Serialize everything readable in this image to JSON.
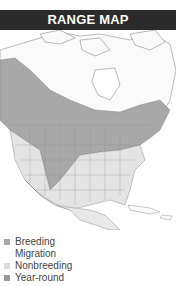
{
  "header": {
    "title": "RANGE MAP"
  },
  "colors": {
    "header_bg": "#2b2b2b",
    "breeding": "#a8a8a8",
    "migration": "#ffffff",
    "nonbreeding": "#dcdcdc",
    "year_round": "#9a9a9a",
    "land": "#f4f4f4",
    "border": "#777777"
  },
  "legend": {
    "items": [
      {
        "label": "Breeding",
        "color": "#a8a8a8"
      },
      {
        "label": "Migration",
        "color": "#ffffff"
      },
      {
        "label": "Nonbreeding",
        "color": "#dcdcdc"
      },
      {
        "label": "Year-round",
        "color": "#9a9a9a"
      }
    ]
  }
}
